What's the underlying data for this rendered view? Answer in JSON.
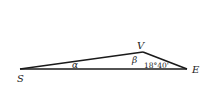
{
  "diagram": {
    "type": "triangle",
    "vertices": [
      {
        "id": "S",
        "label": "S"
      },
      {
        "id": "V",
        "label": "V"
      },
      {
        "id": "E",
        "label": "E"
      }
    ],
    "angles": {
      "at_S": "α",
      "at_V": "β",
      "at_E": "18°40'"
    },
    "colors": {
      "stroke": "#1a1a1a",
      "text": "#222222",
      "background": "#ffffff"
    }
  }
}
